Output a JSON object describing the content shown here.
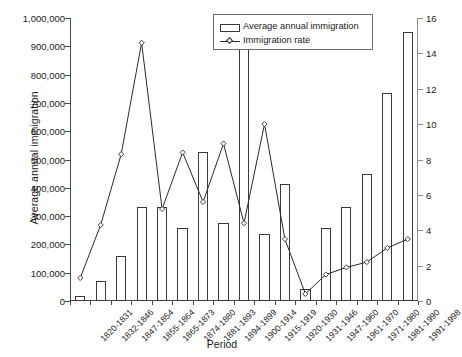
{
  "chart_data": {
    "type": "bar",
    "title": "",
    "xlabel": "Period",
    "ylabel": "Average annual immigration",
    "ylabel_secondary": "",
    "categories": [
      "1820-1831",
      "1832-1846",
      "1847-1854",
      "1855-1864",
      "1865-1873",
      "1874-1880",
      "1881-1893",
      "1894-1899",
      "1900-1914",
      "1915-1919",
      "1920-1930",
      "1931-1946",
      "1947-1960",
      "1961-1970",
      "1971-1980",
      "1981-1990",
      "1991-1998"
    ],
    "series": [
      {
        "name": "Average annual immigration",
        "type": "bar",
        "axis": "left",
        "values": [
          18000,
          72000,
          160000,
          332000,
          332000,
          258000,
          525000,
          275000,
          890000,
          235000,
          412000,
          42000,
          258000,
          332000,
          450000,
          735000,
          950000
        ]
      },
      {
        "name": "Immigration rate",
        "type": "line",
        "axis": "right",
        "marker": "diamond",
        "values": [
          1.3,
          4.3,
          8.3,
          14.6,
          5.2,
          8.4,
          5.6,
          8.9,
          4.4,
          10.0,
          3.5,
          0.4,
          1.5,
          1.9,
          2.2,
          3.0,
          3.5
        ]
      }
    ],
    "ylim": [
      0,
      1000000
    ],
    "yticks": [
      0,
      100000,
      200000,
      300000,
      400000,
      500000,
      600000,
      700000,
      800000,
      900000,
      1000000
    ],
    "yticklabels": [
      "0",
      "100,000",
      "200,000",
      "300,000",
      "400,000",
      "500,000",
      "600,000",
      "700,000",
      "800,000",
      "900,000",
      "1,000,000"
    ],
    "ylim_secondary": [
      0,
      16
    ],
    "yticks_secondary": [
      0,
      2,
      4,
      6,
      8,
      10,
      12,
      14,
      16
    ],
    "yticklabels_secondary": [
      "0",
      "2",
      "4",
      "6",
      "8",
      "10",
      "12",
      "14",
      "16"
    ],
    "grid": false,
    "legend_position": "top-right",
    "legend_entries": [
      {
        "label": "Average annual immigration",
        "marker": "bar-swatch"
      },
      {
        "label": "Immigration rate",
        "marker": "line-diamond"
      }
    ],
    "colors": {
      "bar_fill": "#ffffff",
      "bar_stroke": "#3a3a3a",
      "line": "#2a2a2a",
      "axis": "#4a4a4a",
      "axis_secondary": "#8d8d8d",
      "text": "#1a1a1a"
    }
  }
}
